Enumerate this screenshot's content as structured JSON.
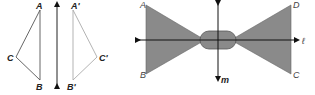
{
  "left_figure": {
    "triangle": {
      "labels": {
        "A": "A",
        "B": "B",
        "C": "C"
      },
      "stroke": "#555555"
    },
    "image_triangle": {
      "labels": {
        "A": "A'",
        "B": "B'",
        "C": "C'"
      },
      "stroke": "#aaaaaa"
    },
    "line_color": "#222222"
  },
  "right_figure": {
    "labels": {
      "A": "A",
      "B": "B",
      "C": "C",
      "D": "D",
      "line_l": "ℓ",
      "line_m": "m"
    },
    "fill": "#8a8a8a",
    "line_color": "#111111"
  }
}
